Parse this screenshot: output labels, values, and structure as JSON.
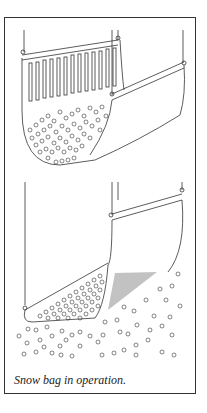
{
  "figure": {
    "caption": "Snow bag in operation.",
    "panels": [
      {
        "name": "top",
        "description": "Snow bag hanging with slotted side panel, filled with snowballs"
      },
      {
        "name": "bottom",
        "description": "Snow bag tilted, releasing snowballs through mesh bottom"
      }
    ],
    "line_color": "#333333"
  }
}
